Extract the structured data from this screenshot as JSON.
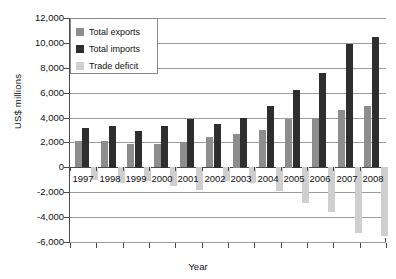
{
  "chart_data": {
    "type": "bar",
    "title": "",
    "xlabel": "Year",
    "ylabel": "US$ millions",
    "categories": [
      "1997",
      "1998",
      "1999",
      "2000",
      "2001",
      "2002",
      "2003",
      "2004",
      "2005",
      "2006",
      "2007",
      "2008"
    ],
    "series": [
      {
        "name": "Total exports",
        "color": "#8d8d8d",
        "values": [
          2100,
          2100,
          1850,
          1850,
          2000,
          2400,
          2700,
          3000,
          3900,
          3950,
          4600,
          4900
        ]
      },
      {
        "name": "Total imports",
        "color": "#2e2e2e",
        "values": [
          3150,
          3350,
          2950,
          3350,
          3850,
          3500,
          3950,
          4950,
          6250,
          7550,
          9900,
          10450
        ]
      },
      {
        "name": "Trade deficit",
        "color": "#cfcfcf",
        "values": [
          -1050,
          -1250,
          -1100,
          -1500,
          -1850,
          -1100,
          -1250,
          -1950,
          -2900,
          -3600,
          -5300,
          -5550
        ]
      }
    ],
    "ylim": [
      -6000,
      12000
    ],
    "yticks": [
      "12,000",
      "10,000",
      "8,000",
      "6,000",
      "4,000",
      "2,000",
      "0",
      "-2,000",
      "-4,000",
      "-6,000"
    ],
    "ytick_values": [
      12000,
      10000,
      8000,
      6000,
      4000,
      2000,
      0,
      -2000,
      -4000,
      -6000
    ],
    "grid": true,
    "legend_position": "top-left"
  },
  "legend": {
    "items": [
      {
        "label": "Total exports"
      },
      {
        "label": "Total imports"
      },
      {
        "label": "Trade deficit"
      }
    ]
  }
}
